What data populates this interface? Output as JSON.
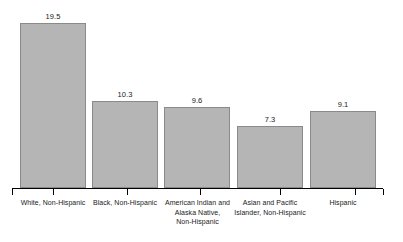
{
  "chart_data": {
    "type": "bar",
    "title": "",
    "subtitle": "",
    "xlabel": "",
    "ylabel": "",
    "ylim": [
      0,
      19.5
    ],
    "grid": false,
    "legend": "none",
    "axis": {
      "x_axis_visible": true,
      "y_axis_visible": false,
      "tick_count": 6
    },
    "categories": [
      "White, Non-Hispanic",
      "Black, Non-Hispanic",
      "American Indian and Alaska Native, Non-Hispanic",
      "Asian and Pacific Islander, Non-Hispanic",
      "Hispanic"
    ],
    "category_lines": [
      [
        "White, Non-Hispanic"
      ],
      [
        "Black, Non-Hispanic"
      ],
      [
        "American Indian and",
        "Alaska Native,",
        "Non-Hispanic"
      ],
      [
        "Asian and Pacific",
        "Islander, Non-Hispanic"
      ],
      [
        "Hispanic"
      ]
    ],
    "values": [
      19.5,
      10.3,
      9.6,
      7.3,
      9.1
    ],
    "value_labels": [
      "19.5",
      "10.3",
      "9.6",
      "7.3",
      "9.1"
    ],
    "colors": {
      "bar_fill": "#b5b5b5",
      "bar_border": "#8a8a8a",
      "axis": "#000000",
      "text": "#1a1a1a",
      "background": "#ffffff"
    }
  }
}
